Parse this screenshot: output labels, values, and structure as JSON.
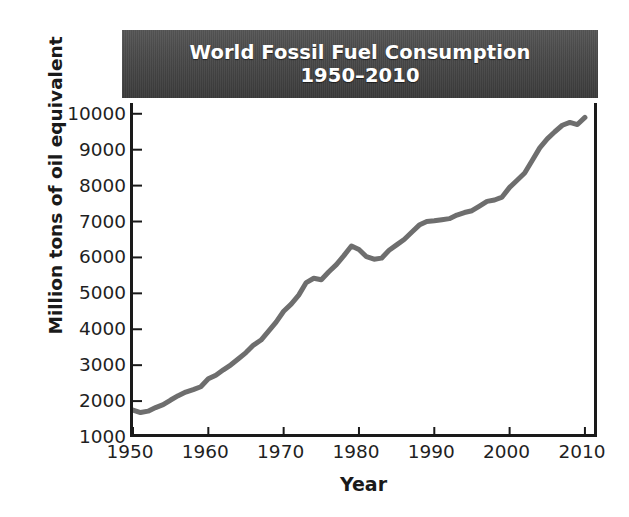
{
  "chart_data": {
    "type": "line",
    "title": "World Fossil Fuel Consumption 1950–2010",
    "title_lines": [
      "World Fossil Fuel Consumption",
      "1950–2010"
    ],
    "xlabel": "Year",
    "ylabel": "Million tons of oil equivalent",
    "xlim": [
      1950,
      2012
    ],
    "ylim": [
      1000,
      10300
    ],
    "xticks": [
      1950,
      1960,
      1970,
      1980,
      1990,
      2000,
      2010
    ],
    "xticklabels": [
      "1950",
      "1960",
      "1970",
      "1980",
      "1990",
      "2000",
      "2010"
    ],
    "yticks": [
      1000,
      2000,
      3000,
      4000,
      5000,
      6000,
      7000,
      8000,
      9000,
      10000
    ],
    "yticklabels": [
      "1000",
      "2000",
      "3000",
      "4000",
      "5000",
      "6000",
      "7000",
      "8000",
      "9000",
      "10000"
    ],
    "grid": false,
    "legend": false,
    "line_color": "#6e6e6e",
    "line_width": 5,
    "series": [
      {
        "name": "World fossil fuel consumption",
        "units": "million tons of oil equivalent",
        "x": [
          1950,
          1951,
          1952,
          1953,
          1954,
          1955,
          1956,
          1957,
          1958,
          1959,
          1960,
          1961,
          1962,
          1963,
          1964,
          1965,
          1966,
          1967,
          1968,
          1969,
          1970,
          1971,
          1972,
          1973,
          1974,
          1975,
          1976,
          1977,
          1978,
          1979,
          1980,
          1981,
          1982,
          1983,
          1984,
          1985,
          1986,
          1987,
          1988,
          1989,
          1990,
          1991,
          1992,
          1993,
          1994,
          1995,
          1996,
          1997,
          1998,
          1999,
          2000,
          2001,
          2002,
          2003,
          2004,
          2005,
          2006,
          2007,
          2008,
          2009,
          2010
        ],
        "values": [
          1750,
          1680,
          1720,
          1820,
          1900,
          2030,
          2150,
          2250,
          2320,
          2400,
          2620,
          2720,
          2870,
          3010,
          3180,
          3350,
          3560,
          3700,
          3950,
          4200,
          4500,
          4700,
          4950,
          5300,
          5420,
          5380,
          5600,
          5800,
          6050,
          6320,
          6220,
          6020,
          5950,
          5980,
          6200,
          6350,
          6500,
          6700,
          6900,
          7000,
          7020,
          7050,
          7080,
          7180,
          7250,
          7300,
          7430,
          7560,
          7600,
          7680,
          7950,
          8150,
          8350,
          8700,
          9050,
          9300,
          9500,
          9680,
          9760,
          9700,
          9900
        ]
      }
    ],
    "annotations": [
      {
        "label": "1973 oil shock plateau",
        "year": 1975,
        "value": 5380
      },
      {
        "label": "early-1980s decline",
        "year": 1982,
        "value": 5950
      },
      {
        "label": "late-1990s plateau",
        "year": 1998,
        "value": 7600
      },
      {
        "label": "2000s rapid growth",
        "year": 2010,
        "value": 9900
      }
    ]
  },
  "figure": {
    "background_color": "#ffffff",
    "banner_color": "#4a4a4a",
    "banner_text_color": "#ffffff",
    "axis_color": "#1a1a1a"
  }
}
